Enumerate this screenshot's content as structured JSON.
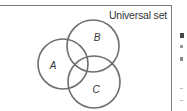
{
  "diagram": {
    "type": "venn",
    "universal_label": "Universal set",
    "sets": [
      {
        "label": "A",
        "cx": 63,
        "cy": 64,
        "r": 25,
        "label_x": 53,
        "label_y": 69
      },
      {
        "label": "B",
        "cx": 93,
        "cy": 46,
        "r": 26,
        "label_x": 97,
        "label_y": 41
      },
      {
        "label": "C",
        "cx": 94,
        "cy": 82,
        "r": 26,
        "label_x": 96,
        "label_y": 93
      }
    ],
    "stroke_color": "#6e6e6e"
  }
}
